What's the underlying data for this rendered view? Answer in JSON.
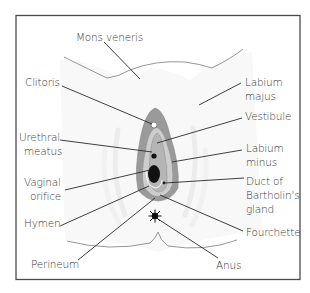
{
  "diagram": {
    "colors": {
      "frame": "#4a4a4a",
      "background": "#ffffff",
      "skin": "#f7f7f7",
      "labia_outer": "#9a9a9a",
      "labia_inner": "#c8c8c8",
      "vestibule": "#b5b5b5",
      "orifice": "#111111",
      "text": "#3a3a3a"
    },
    "labels": {
      "mons_veneris": "Mons veneris",
      "clitoris": "Clitoris",
      "urethral_meatus_1": "Urethral",
      "urethral_meatus_2": "meatus",
      "vaginal_orifice_1": "Vaginal",
      "vaginal_orifice_2": "orifice",
      "hymen": "Hymen",
      "perineum": "Perineum",
      "labium_majus_1": "Labium",
      "labium_majus_2": "majus",
      "vestibule": "Vestibule",
      "labium_minus_1": "Labium",
      "labium_minus_2": "minus",
      "duct_1": "Duct of",
      "duct_2": "Bartholin's",
      "duct_3": "gland",
      "fourchette": "Fourchette",
      "anus": "Anus"
    }
  }
}
